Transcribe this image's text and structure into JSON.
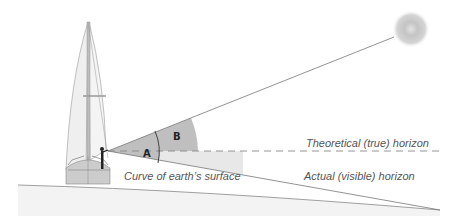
{
  "diagram": {
    "labels": {
      "theoretical_horizon": "Theoretical (true) horizon",
      "actual_horizon": "Actual (visible) horizon",
      "earth_surface": "Curve of earth’s surface",
      "angle_a": "A",
      "angle_b": "B"
    },
    "elements": [
      "sailboat",
      "observer",
      "sun",
      "sight-line-to-sun",
      "theoretical-horizon-dashed-line",
      "actual-horizon-line",
      "earth-surface-curve",
      "angle-A-dip",
      "angle-B-altitude"
    ],
    "colors": {
      "line": "#777777",
      "sector_dark": "#bdbdbd",
      "sector_light": "#e6e6e6",
      "sea": "#f2f2f2",
      "hull": "#c8c8c8",
      "sail": "#efefef",
      "sun": "#c9c9c9"
    }
  }
}
